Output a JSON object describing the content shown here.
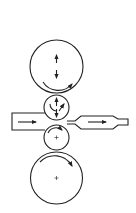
{
  "diagram": {
    "type": "four-high rolling mill",
    "stroke_color": "#222222",
    "background": "#ffffff",
    "rolls": [
      {
        "name": "upper-backup-roll",
        "cx": 56.5,
        "cy": 66.5,
        "r": 26.5
      },
      {
        "name": "upper-work-roll",
        "cx": 56.5,
        "cy": 107.5,
        "r": 12.5
      },
      {
        "name": "lower-work-roll",
        "cx": 56.5,
        "cy": 137.5,
        "r": 12.5
      },
      {
        "name": "lower-backup-roll",
        "cx": 56.5,
        "cy": 178,
        "r": 26
      }
    ],
    "strip": {
      "direction": "left-to-right"
    }
  }
}
